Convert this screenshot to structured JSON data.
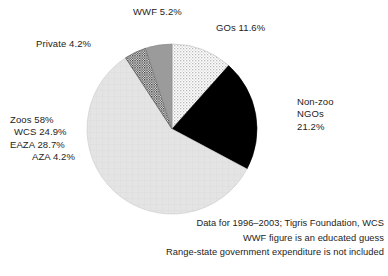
{
  "chart_data": {
    "type": "pie",
    "title": "",
    "subtitle": "",
    "xlabel": "",
    "ylabel": "",
    "legend_position": "none",
    "grid": false,
    "start_angle_deg": 0,
    "direction": "clockwise",
    "units": "percent",
    "categories": [
      "GOs",
      "Non-zoo NGOs",
      "Zoos",
      "Private",
      "WWF"
    ],
    "values": [
      11.6,
      21.2,
      58.0,
      4.2,
      5.2
    ],
    "slices": [
      {
        "name": "GOs",
        "label": "GOs 11.6%",
        "value": 11.6,
        "fill_style": "light-stipple",
        "color": "#e8e8e8",
        "start_deg": 0.0,
        "end_deg": 41.76
      },
      {
        "name": "Non-zoo NGOs",
        "label": "Non-zoo NGOs 21.2%",
        "value": 21.2,
        "fill_style": "solid-black",
        "color": "#000000",
        "start_deg": 41.76,
        "end_deg": 118.08
      },
      {
        "name": "Zoos",
        "label": "Zoos 58%",
        "value": 58.0,
        "fill_style": "solid-light-gray",
        "color": "#e3e3e3",
        "start_deg": 118.08,
        "end_deg": 326.88
      },
      {
        "name": "Private",
        "label": "Private 4.2%",
        "value": 4.2,
        "fill_style": "dark-crosshatch",
        "color": "#5a5a5a",
        "start_deg": 326.88,
        "end_deg": 342.0
      },
      {
        "name": "WWF",
        "label": "WWF 5.2%",
        "value": 5.2,
        "fill_style": "solid-medium-gray",
        "color": "#9b9b9b",
        "start_deg": 342.0,
        "end_deg": 360.0
      }
    ],
    "breakdown": {
      "parent": "Zoos",
      "items": [
        {
          "label": "WCS 24.9%",
          "name": "WCS",
          "value": 24.9,
          "style": "normal"
        },
        {
          "label": "EAZA 28.7%",
          "name": "EAZA",
          "value": 28.7,
          "style": "italic"
        },
        {
          "label": "AZA 4.2%",
          "name": "AZA",
          "value": 4.2,
          "style": "italic"
        }
      ]
    },
    "annotations": [
      "Data for 1996–2003; Tigris Foundation, WCS",
      "WWF figure is an educated guess",
      "Range-state government expenditure is not included"
    ]
  },
  "labels": {
    "wwf": "WWF 5.2%",
    "gos": "GOs 11.6%",
    "private": "Private 4.2%",
    "nonzoo_line1": "Non-zoo",
    "nonzoo_line2": "NGOs",
    "nonzoo_line3": "21.2%",
    "zoos_line1": "Zoos 58%",
    "zoos_line2": "WCS 24.9%",
    "zoos_line3": "EAZA 28.7%",
    "zoos_line4": "AZA 4.2%"
  },
  "footnotes": {
    "line1": "Data for 1996–2003; Tigris Foundation, WCS",
    "line2": "WWF figure is an educated guess",
    "line3": "Range-state government expenditure is not included"
  },
  "colors": {
    "background": "#ffffff",
    "text": "#1d1d1d",
    "slice_gos": "#e8e8e8",
    "slice_nonzoo_ngos": "#000000",
    "slice_zoos": "#e3e3e3",
    "slice_private": "#5a5a5a",
    "slice_wwf": "#9b9b9b"
  }
}
